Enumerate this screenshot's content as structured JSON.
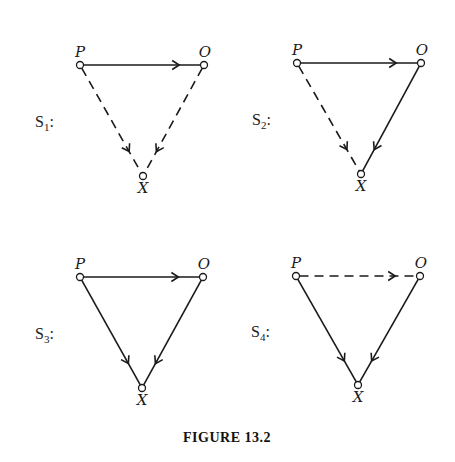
{
  "figure": {
    "caption": "FIGURE 13.2",
    "node_labels": {
      "P": "P",
      "O": "O",
      "X": "X"
    },
    "diagrams": [
      {
        "id": "S1",
        "label_main": "S",
        "label_sub": "1",
        "label_suffix": ":",
        "nodes": {
          "P": [
            80,
            65
          ],
          "O": [
            204,
            65
          ],
          "X": [
            143,
            176
          ]
        },
        "edges": [
          {
            "from": "P",
            "to": "O",
            "style": "solid"
          },
          {
            "from": "P",
            "to": "X",
            "style": "dashed"
          },
          {
            "from": "O",
            "to": "X",
            "style": "dashed"
          }
        ]
      },
      {
        "id": "S2",
        "label_main": "S",
        "label_sub": "2",
        "label_suffix": ":",
        "nodes": {
          "P": [
            297,
            63
          ],
          "O": [
            421,
            63
          ],
          "X": [
            361,
            174
          ]
        },
        "edges": [
          {
            "from": "P",
            "to": "O",
            "style": "solid"
          },
          {
            "from": "P",
            "to": "X",
            "style": "dashed"
          },
          {
            "from": "O",
            "to": "X",
            "style": "solid"
          }
        ]
      },
      {
        "id": "S3",
        "label_main": "S",
        "label_sub": "3",
        "label_suffix": ":",
        "nodes": {
          "P": [
            80,
            277
          ],
          "O": [
            203,
            277
          ],
          "X": [
            142,
            388
          ]
        },
        "edges": [
          {
            "from": "P",
            "to": "O",
            "style": "solid"
          },
          {
            "from": "P",
            "to": "X",
            "style": "solid"
          },
          {
            "from": "O",
            "to": "X",
            "style": "solid"
          }
        ]
      },
      {
        "id": "S4",
        "label_main": "S",
        "label_sub": "4",
        "label_suffix": ":",
        "nodes": {
          "P": [
            296,
            276
          ],
          "O": [
            420,
            276
          ],
          "X": [
            358,
            385
          ]
        },
        "edges": [
          {
            "from": "P",
            "to": "O",
            "style": "dashed"
          },
          {
            "from": "P",
            "to": "X",
            "style": "solid"
          },
          {
            "from": "O",
            "to": "X",
            "style": "solid"
          }
        ]
      }
    ]
  }
}
